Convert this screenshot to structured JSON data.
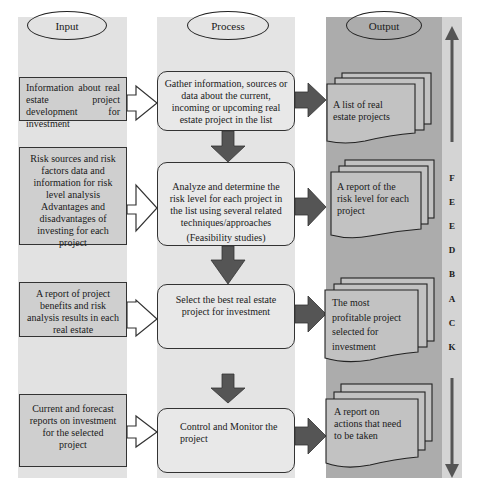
{
  "columns": {
    "input": {
      "label": "Input"
    },
    "process": {
      "label": "Process"
    },
    "output": {
      "label": "Output"
    }
  },
  "rows": [
    {
      "input": "Information about real estate project development for investment",
      "process": "Gather information, sources or data about the current, incoming or upcoming real estate project in the list",
      "output": [
        "A list of real",
        "estate projects"
      ]
    },
    {
      "input": "Risk sources and risk factors data and information for risk level analysis Advantages and disadvantages of investing for each project",
      "process": "Analyze and determine the risk level for each project in the list using several related techniques/approaches",
      "process_sub": "(Feasibility studies)",
      "output": [
        "A report of the",
        "risk level for each",
        "project"
      ]
    },
    {
      "input": "A report of project benefits and risk analysis results in each real estate",
      "process": "Select the best real estate project for investment",
      "output": [
        "The most",
        "profitable project",
        "selected for",
        "investment"
      ]
    },
    {
      "input": "Current and forecast reports on investment for the selected project",
      "process": "Control and Monitor the project",
      "output": [
        "A report on",
        "actions that need",
        "to be taken"
      ]
    }
  ],
  "feedback": {
    "letters": [
      "F",
      "E",
      "E",
      "D",
      "B",
      "A",
      "C",
      "K"
    ],
    "icons": [
      "arrow-up-icon",
      "arrow-down-icon"
    ]
  },
  "colors": {
    "input_bg": "#e2e2e2",
    "process_bg": "#e4e4e4",
    "output_bg": "#acacac",
    "feedback_bg": "#d4d4d4",
    "arrow_fill": "#555555",
    "box_fill": "#cfcfcf"
  }
}
